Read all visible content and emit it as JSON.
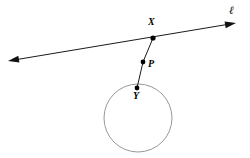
{
  "figure": {
    "background_color": "#ffffff",
    "width": 250,
    "height": 158,
    "stroke_color": "#1a1a1a",
    "circle_stroke_color": "#8c8c8c",
    "point_fill_color": "#000000"
  },
  "labels": {
    "line_l": "ℓ",
    "point_x": "X",
    "point_p": "P",
    "point_y": "Y"
  },
  "geometry": {
    "line": {
      "name": "line-l",
      "x1": 8,
      "y1": 61,
      "x2": 236,
      "y2": 23,
      "arrow_start": true,
      "arrow_end": true
    },
    "segment_xp": {
      "x1": 153,
      "y1": 38,
      "x2": 143,
      "y2": 62
    },
    "segment_py": {
      "x1": 143,
      "y1": 62,
      "x2": 137,
      "y2": 88
    },
    "circle": {
      "cx": 138,
      "cy": 118,
      "r": 34
    },
    "points": [
      {
        "id": "X",
        "cx": 153,
        "cy": 38,
        "r": 2.6
      },
      {
        "id": "P",
        "cx": 143,
        "cy": 62,
        "r": 2.4
      },
      {
        "id": "Y",
        "cx": 137,
        "cy": 88,
        "r": 2.4
      }
    ],
    "label_positions": {
      "line_l": {
        "left": 229,
        "top": 5
      },
      "point_x": {
        "left": 148,
        "top": 17
      },
      "point_p": {
        "left": 148,
        "top": 59
      },
      "point_y": {
        "left": 133,
        "top": 91
      }
    }
  }
}
